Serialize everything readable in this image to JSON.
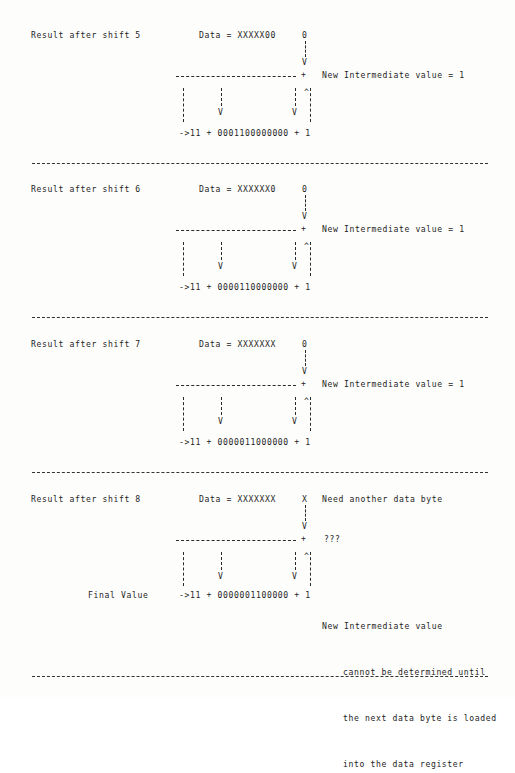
{
  "document": {
    "kind": "ascii-art-diagram",
    "subject": "CRC shift register accumulation after successive shifts",
    "ink_color": "#1d1d1d",
    "rule_color": "#2a2a2a",
    "separator_color": "#333333",
    "background_color": "#fdfdfc"
  },
  "labels": {
    "data_prefix": "Data = ",
    "plus": "+",
    "arrow_down": "V",
    "arrow_up": "^",
    "final_value": "Final Value",
    "intermediate_result": "New Intermediate value = 1",
    "unknown_result": "???",
    "need_byte": "Need another data byte"
  },
  "blocks": [
    {
      "id": "shift-5",
      "title": "Result after shift 5",
      "data_register": "XXXXX00",
      "incoming_bit": "0",
      "note": "New Intermediate value = 1",
      "sum_row": "->11 + 0001100000000 + 1",
      "poly_value": "0001100000000",
      "crc_prefix": "->11",
      "carry_in": "1",
      "has_final_label": false,
      "annotation_lines": []
    },
    {
      "id": "shift-6",
      "title": "Result after shift 6",
      "data_register": "XXXXXX0",
      "incoming_bit": "0",
      "note": "New Intermediate value = 1",
      "sum_row": "->11 + 0000110000000 + 1",
      "poly_value": "0000110000000",
      "crc_prefix": "->11",
      "carry_in": "1",
      "has_final_label": false,
      "annotation_lines": []
    },
    {
      "id": "shift-7",
      "title": "Result after shift 7",
      "data_register": "XXXXXXX",
      "incoming_bit": "0",
      "note": "New Intermediate value = 1",
      "sum_row": "->11 + 0000011000000 + 1",
      "poly_value": "0000011000000",
      "crc_prefix": "->11",
      "carry_in": "1",
      "has_final_label": false,
      "annotation_lines": []
    },
    {
      "id": "shift-8",
      "title": "Result after shift 8",
      "data_register": "XXXXXXX",
      "incoming_bit": "X",
      "incoming_note": "Need another data byte",
      "note": "???",
      "sum_row": "->11 + 0000001100000 + 1",
      "poly_value": "0000001100000",
      "crc_prefix": "->11",
      "carry_in": "1",
      "has_final_label": true,
      "final_label": "Final Value",
      "annotation_lines": [
        "New Intermediate value",
        "cannot be determined until",
        "the next data byte is loaded",
        "into the data register"
      ]
    }
  ]
}
